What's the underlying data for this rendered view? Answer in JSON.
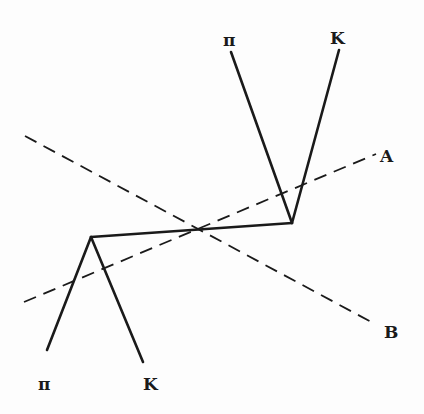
{
  "diagram": {
    "title": "",
    "colors": {
      "line": "#1a1a1a",
      "background": "#fdfdfd"
    },
    "labels": {
      "top_pi": "π",
      "top_k": "K",
      "bottom_pi": "π",
      "bottom_k": "K",
      "axis_a": "A",
      "axis_b": "B"
    },
    "vertices": {
      "left": [
        91,
        237
      ],
      "right": [
        292,
        223
      ]
    },
    "tracks": [
      {
        "name": "connecting",
        "from": [
          91,
          237
        ],
        "to": [
          292,
          223
        ]
      },
      {
        "name": "upper-pi",
        "from": [
          292,
          223
        ],
        "to": [
          231,
          52
        ]
      },
      {
        "name": "upper-k",
        "from": [
          292,
          223
        ],
        "to": [
          339,
          50
        ]
      },
      {
        "name": "lower-pi",
        "from": [
          91,
          237
        ],
        "to": [
          47,
          350
        ]
      },
      {
        "name": "lower-k",
        "from": [
          91,
          237
        ],
        "to": [
          143,
          362
        ]
      }
    ],
    "dashed_axes": [
      {
        "name": "A",
        "from": [
          24,
          302
        ],
        "to": [
          376,
          154
        ]
      },
      {
        "name": "B",
        "from": [
          25,
          136
        ],
        "to": [
          375,
          324
        ]
      }
    ]
  }
}
